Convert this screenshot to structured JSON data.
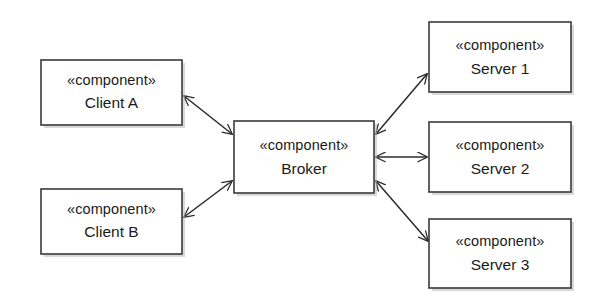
{
  "diagram": {
    "kind": "uml-component-diagram",
    "background_color": "#ffffff",
    "box_fill_color": "#ffffff",
    "box_border_color": "#3a3a3a",
    "connector_color": "#2b2b2b",
    "text_color": "#1a1a1a",
    "stereotype_open": "«",
    "stereotype_close": "»",
    "nodes": [
      {
        "id": "client-a",
        "stereotype": "«component»",
        "name": "Client A",
        "x": 41,
        "y": 60,
        "width": 141,
        "height": 65
      },
      {
        "id": "client-b",
        "stereotype": "«component»",
        "name": "Client B",
        "x": 41,
        "y": 189,
        "width": 141,
        "height": 65
      },
      {
        "id": "broker",
        "stereotype": "«component»",
        "name": "Broker",
        "x": 234,
        "y": 121,
        "width": 140,
        "height": 72
      },
      {
        "id": "server-1",
        "stereotype": "«component»",
        "name": "Server 1",
        "x": 429,
        "y": 22,
        "width": 142,
        "height": 70
      },
      {
        "id": "server-2",
        "stereotype": "«component»",
        "name": "Server 2",
        "x": 429,
        "y": 122,
        "width": 142,
        "height": 70
      },
      {
        "id": "server-3",
        "stereotype": "«component»",
        "name": "Server 3",
        "x": 429,
        "y": 219,
        "width": 142,
        "height": 69
      }
    ],
    "connectors": [
      {
        "id": "client-a-broker",
        "from": "client-a",
        "to": "broker",
        "arrowheads": "both",
        "x1": 184,
        "y1": 96,
        "x2": 232,
        "y2": 134
      },
      {
        "id": "client-b-broker",
        "from": "broker",
        "to": "client-b",
        "arrowheads": "both",
        "x1": 232,
        "y1": 181,
        "x2": 184,
        "y2": 217
      },
      {
        "id": "broker-server-1",
        "from": "broker",
        "to": "server-1",
        "arrowheads": "both",
        "x1": 376,
        "y1": 134,
        "x2": 427,
        "y2": 74
      },
      {
        "id": "broker-server-2",
        "from": "broker",
        "to": "server-2",
        "arrowheads": "both",
        "x1": 376,
        "y1": 157,
        "x2": 427,
        "y2": 157
      },
      {
        "id": "broker-server-3",
        "from": "broker",
        "to": "server-3",
        "arrowheads": "both",
        "x1": 376,
        "y1": 181,
        "x2": 428,
        "y2": 241
      }
    ]
  }
}
